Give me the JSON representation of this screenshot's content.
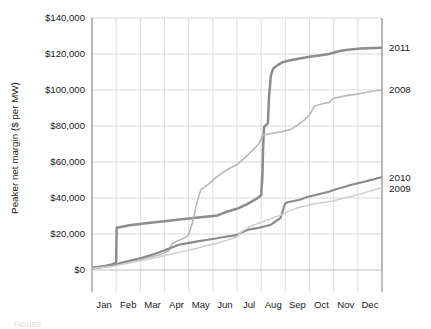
{
  "figure": {
    "caption": "FIGURE"
  },
  "chart_data": {
    "type": "line",
    "title": "",
    "xlabel": "",
    "ylabel": "Peaker net margin ($ per MW)",
    "ylim": [
      0,
      140000
    ],
    "yticks": [
      0,
      20000,
      40000,
      60000,
      80000,
      100000,
      120000,
      140000
    ],
    "ytick_labels": [
      "$0",
      "$20,000",
      "$40,000",
      "$60,000",
      "$80,000",
      "$100,000",
      "$120,000",
      "$140,000"
    ],
    "categories": [
      "Jan",
      "Feb",
      "Mar",
      "Apr",
      "May",
      "Jun",
      "Jul",
      "Aug",
      "Sep",
      "Oct",
      "Nov",
      "Dec"
    ],
    "xlim": [
      0,
      12
    ],
    "grid": "horizontal-and-vertical",
    "legend_position": "right-edge-inline",
    "series": [
      {
        "name": "2011",
        "color": "#8c8c8c",
        "final_value": 123500,
        "x": [
          0.0,
          0.3,
          0.6,
          0.85,
          0.95,
          1.0,
          1.02,
          1.3,
          1.6,
          2.0,
          2.4,
          2.8,
          3.2,
          3.6,
          4.0,
          4.4,
          4.8,
          5.2,
          5.6,
          6.0,
          6.4,
          6.6,
          6.8,
          7.0,
          7.05,
          7.08,
          7.12,
          7.2,
          7.28,
          7.32,
          7.4,
          7.5,
          7.7,
          7.9,
          8.2,
          8.6,
          9.0,
          9.4,
          9.8,
          10.2,
          10.5,
          10.8,
          11.1,
          11.4,
          11.7,
          12.0
        ],
        "y": [
          1200,
          1800,
          2400,
          3200,
          3800,
          4200,
          23500,
          24200,
          25000,
          25600,
          26200,
          26800,
          27400,
          28000,
          28600,
          29200,
          29700,
          30300,
          32500,
          34000,
          36500,
          38000,
          39500,
          41500,
          52000,
          68000,
          79500,
          80500,
          81500,
          95000,
          108000,
          112000,
          114000,
          115500,
          116500,
          117500,
          118500,
          119200,
          120000,
          121500,
          122200,
          122700,
          123000,
          123200,
          123400,
          123500
        ]
      },
      {
        "name": "2008",
        "color": "#b8b8b8",
        "final_value": 100000,
        "x": [
          0.0,
          0.4,
          0.8,
          1.2,
          1.6,
          2.0,
          2.4,
          2.8,
          3.0,
          3.2,
          3.3,
          3.5,
          3.7,
          3.9,
          4.0,
          4.05,
          4.15,
          4.25,
          4.35,
          4.5,
          4.7,
          4.9,
          5.1,
          5.4,
          5.7,
          6.0,
          6.3,
          6.6,
          6.9,
          7.0,
          7.05,
          7.1,
          7.3,
          7.6,
          7.9,
          8.2,
          8.4,
          8.6,
          8.8,
          9.0,
          9.1,
          9.2,
          9.4,
          9.6,
          9.8,
          10.0,
          10.3,
          10.6,
          11.0,
          11.3,
          11.6,
          11.8,
          12.0
        ],
        "y": [
          1000,
          1600,
          2400,
          3600,
          4800,
          6000,
          7200,
          8500,
          9500,
          11000,
          14500,
          16000,
          17000,
          18500,
          19500,
          22000,
          26000,
          32000,
          38000,
          44500,
          46500,
          48500,
          51000,
          54000,
          56500,
          58500,
          62000,
          66000,
          70000,
          72500,
          74500,
          75000,
          75600,
          76200,
          77000,
          78000,
          79500,
          81500,
          83500,
          86000,
          88500,
          91000,
          91800,
          92500,
          93000,
          95500,
          96200,
          97000,
          97800,
          98600,
          99300,
          99700,
          100000
        ]
      },
      {
        "name": "2010",
        "color": "#8a8a8a",
        "final_value": 51500,
        "x": [
          0.0,
          0.4,
          0.8,
          1.0,
          1.2,
          1.5,
          1.8,
          2.1,
          2.4,
          2.7,
          3.0,
          3.3,
          3.6,
          3.9,
          4.2,
          4.5,
          4.8,
          5.1,
          5.4,
          5.7,
          6.0,
          6.3,
          6.5,
          6.7,
          6.9,
          7.0,
          7.2,
          7.4,
          7.6,
          7.8,
          7.9,
          7.95,
          8.0,
          8.1,
          8.3,
          8.6,
          8.9,
          9.2,
          9.5,
          9.8,
          10.1,
          10.4,
          10.7,
          11.0,
          11.3,
          11.6,
          11.8,
          12.0
        ],
        "y": [
          900,
          1500,
          2200,
          2900,
          4000,
          5000,
          6000,
          7000,
          8200,
          9500,
          11000,
          12500,
          14000,
          14800,
          15500,
          16200,
          16800,
          17500,
          18200,
          18800,
          19500,
          21500,
          22500,
          23000,
          23400,
          23800,
          24400,
          25200,
          27000,
          29000,
          33000,
          35500,
          37000,
          37600,
          38200,
          39000,
          40500,
          41500,
          42500,
          43500,
          44800,
          46000,
          47200,
          48200,
          49200,
          50200,
          51000,
          51500
        ]
      },
      {
        "name": "2009",
        "color": "#cfcfcf",
        "final_value": 45500,
        "x": [
          0.0,
          0.4,
          0.8,
          1.2,
          1.6,
          2.0,
          2.4,
          2.8,
          3.2,
          3.6,
          4.0,
          4.3,
          4.6,
          4.9,
          5.2,
          5.5,
          5.8,
          6.0,
          6.2,
          6.4,
          6.5,
          6.7,
          7.0,
          7.3,
          7.6,
          7.9,
          8.2,
          8.5,
          8.8,
          9.1,
          9.4,
          9.7,
          10.0,
          10.3,
          10.6,
          11.0,
          11.3,
          11.6,
          11.8,
          12.0
        ],
        "y": [
          800,
          1400,
          2000,
          3000,
          4000,
          5000,
          6200,
          7400,
          8600,
          9800,
          11000,
          12000,
          13000,
          14000,
          15000,
          16200,
          17500,
          18500,
          21500,
          23000,
          24000,
          25000,
          26500,
          28000,
          29500,
          31000,
          33000,
          34500,
          35500,
          36500,
          37200,
          37800,
          38500,
          39500,
          40500,
          41800,
          43000,
          44200,
          45000,
          45500
        ]
      }
    ],
    "series_labels": [
      {
        "name": "2011",
        "value": 123500
      },
      {
        "name": "2008",
        "value": 100000
      },
      {
        "name": "2010",
        "value": 51500
      },
      {
        "name": "2009",
        "value": 45500
      }
    ]
  }
}
